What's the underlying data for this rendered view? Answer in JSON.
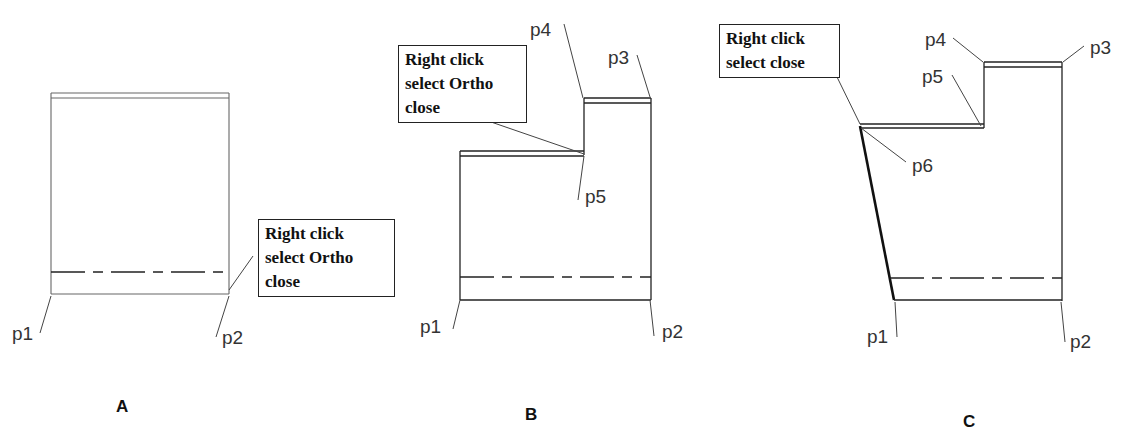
{
  "panels": [
    {
      "id": "A",
      "label": "A",
      "points": {
        "p1": "p1",
        "p2": "p2"
      },
      "callout": [
        "Right click",
        "select Ortho",
        "close"
      ]
    },
    {
      "id": "B",
      "label": "B",
      "points": {
        "p1": "p1",
        "p2": "p2",
        "p3": "p3",
        "p4": "p4",
        "p5": "p5"
      },
      "callout": [
        "Right click",
        "select Ortho",
        "close"
      ]
    },
    {
      "id": "C",
      "label": "C",
      "points": {
        "p1": "p1",
        "p2": "p2",
        "p3": "p3",
        "p4": "p4",
        "p5": "p5",
        "p6": "p6"
      },
      "callout": [
        "Right click",
        "select close"
      ]
    }
  ]
}
